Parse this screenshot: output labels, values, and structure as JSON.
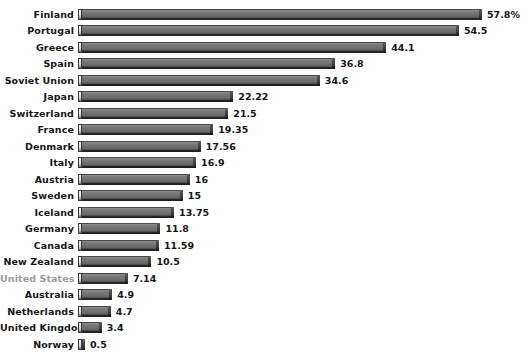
{
  "chart_data": {
    "type": "bar",
    "orientation": "horizontal",
    "title": "",
    "subtitle": "",
    "xlabel": "",
    "ylabel": "",
    "grid": false,
    "legend": null,
    "axis_visible": false,
    "background_color": "#ffffff",
    "bar_color": "#6c6c6c",
    "label_color": "#161616",
    "highlight_label_color": "#9a9a9a",
    "highlighted_categories": [
      "United States"
    ],
    "value_unit": "%",
    "xlim": [
      0,
      57.8
    ],
    "categories": [
      "Finland",
      "Portugal",
      "Greece",
      "Spain",
      "Soviet Union",
      "Japan",
      "Switzerland",
      "France",
      "Denmark",
      "Italy",
      "Austria",
      "Sweden",
      "Iceland",
      "Germany",
      "Canada",
      "New Zealand",
      "United States",
      "Australia",
      "Netherlands",
      "United Kingdom",
      "Norway"
    ],
    "values": [
      57.8,
      54.5,
      44.1,
      36.8,
      34.6,
      22.22,
      21.5,
      19.35,
      17.56,
      16.9,
      16,
      15,
      13.75,
      11.8,
      11.59,
      10.5,
      7.14,
      4.9,
      4.7,
      3.4,
      0.5
    ],
    "value_labels": [
      "57.8%",
      "54.5",
      "44.1",
      "36.8",
      "34.6",
      "22.22",
      "21.5",
      "19.35",
      "17.56",
      "16.9",
      "16",
      "15",
      "13.75",
      "11.8",
      "11.59",
      "10.5",
      "7.14",
      "4.9",
      "4.7",
      "3.4",
      "0.5"
    ]
  }
}
